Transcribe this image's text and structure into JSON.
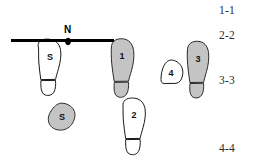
{
  "diagram": {
    "background_color": "#ffffff",
    "stroke_color": "#1a1a1a",
    "fill_gray": "#c4c4c4",
    "fill_white": "#ffffff",
    "baseline": {
      "name": "baseline",
      "color": "#000000",
      "node": {
        "label": "N",
        "x": 68,
        "y": 41
      }
    },
    "prints": [
      {
        "id": "print-s-upper",
        "label": "S",
        "fill": "white",
        "type": "shoeprint",
        "x": 50,
        "y": 66
      },
      {
        "id": "print-s-lower",
        "label": "S",
        "fill": "gray",
        "type": "partial",
        "x": 62,
        "y": 117
      },
      {
        "id": "print-1",
        "label": "1",
        "fill": "gray",
        "type": "shoeprint",
        "x": 122,
        "y": 63
      },
      {
        "id": "print-2",
        "label": "2",
        "fill": "white",
        "type": "shoeprint",
        "x": 134,
        "y": 119
      },
      {
        "id": "print-3",
        "label": "3",
        "fill": "gray",
        "type": "shoeprint",
        "x": 198,
        "y": 69
      },
      {
        "id": "print-4",
        "label": "4",
        "fill": "white",
        "type": "partial",
        "x": 171,
        "y": 73
      }
    ],
    "section_labels": [
      {
        "text": "1-1",
        "top": 4,
        "left": 219
      },
      {
        "text": "2-2",
        "top": 29,
        "left": 219
      },
      {
        "text": "3-3",
        "top": 74,
        "left": 219
      },
      {
        "text": "4-4",
        "top": 142,
        "left": 219
      }
    ]
  }
}
